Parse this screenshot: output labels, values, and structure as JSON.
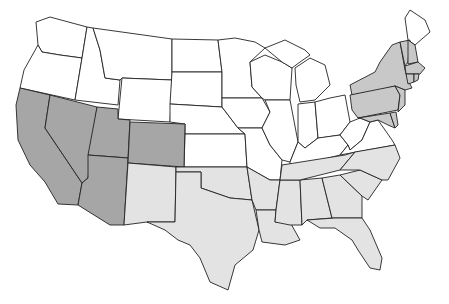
{
  "map": {
    "title": "",
    "type": "choropleth",
    "region": "United States (contiguous)",
    "colors": {
      "west_group": "#a6a6a6",
      "south_group": "#e3e3e3",
      "northeast_group": "#c8c8c8",
      "other": "#ffffff",
      "border": "#222222"
    },
    "groups": [
      {
        "name": "west_group",
        "states": [
          "California",
          "Nevada",
          "Utah",
          "Arizona",
          "Colorado"
        ]
      },
      {
        "name": "south_group",
        "states": [
          "New Mexico",
          "Texas",
          "Oklahoma",
          "Arkansas",
          "Louisiana",
          "Mississippi",
          "Alabama",
          "Georgia",
          "Florida",
          "South Carolina",
          "North Carolina",
          "Tennessee"
        ]
      },
      {
        "name": "northeast_group",
        "states": [
          "New York",
          "Pennsylvania",
          "New Jersey",
          "Delaware",
          "Maryland",
          "Connecticut",
          "Rhode Island",
          "Massachusetts",
          "Vermont",
          "New Hampshire"
        ]
      },
      {
        "name": "other",
        "states": [
          "Washington",
          "Oregon",
          "Idaho",
          "Montana",
          "Wyoming",
          "North Dakota",
          "South Dakota",
          "Nebraska",
          "Kansas",
          "Minnesota",
          "Iowa",
          "Missouri",
          "Wisconsin",
          "Illinois",
          "Michigan",
          "Indiana",
          "Ohio",
          "Kentucky",
          "West Virginia",
          "Virginia",
          "Maine"
        ]
      }
    ]
  }
}
